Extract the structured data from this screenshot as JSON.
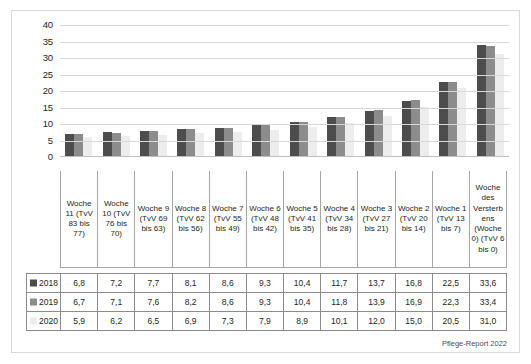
{
  "footer": {
    "source": "Pflege-Report 2022"
  },
  "legend": {
    "items": [
      {
        "label": "2018",
        "color": "#4d4d4d"
      },
      {
        "label": "2019",
        "color": "#8c8c8c"
      },
      {
        "label": "2020",
        "color": "#ededed"
      }
    ]
  },
  "chart_data": {
    "type": "bar",
    "title": "",
    "xlabel": "",
    "ylabel": "",
    "ylim": [
      0,
      40
    ],
    "yticks": [
      0,
      5,
      10,
      15,
      20,
      25,
      30,
      35,
      40
    ],
    "grid": true,
    "legend_position": "table-row-headers",
    "categories": [
      "Woche 11 (TvV 83 bis 77)",
      "Woche 10 (TvV 76 bis 70)",
      "Woche 9 (TvV 69 bis 63)",
      "Woche 8 (TvV 62 bis 56)",
      "Woche 7 (TvV 55 bis 49)",
      "Woche 6 (TvV 48 bis 42)",
      "Woche 5 (TvV 41 bis 35)",
      "Woche 4 (TvV 34 bis 28)",
      "Woche 3 (TvV 27 bis 21)",
      "Woche 2 (TvV 20 bis 14)",
      "Woche 1 (TvV 13 bis 7)",
      "Woche des Versterbens (Woche 0) (TvV 6 bis 0)"
    ],
    "series": [
      {
        "name": "2018",
        "color": "#4d4d4d",
        "values": [
          6.8,
          7.2,
          7.7,
          8.1,
          8.6,
          9.3,
          10.4,
          11.7,
          13.7,
          16.8,
          22.5,
          33.6
        ]
      },
      {
        "name": "2019",
        "color": "#8c8c8c",
        "values": [
          6.7,
          7.1,
          7.6,
          8.2,
          8.6,
          9.3,
          10.4,
          11.8,
          13.9,
          16.9,
          22.3,
          33.4
        ]
      },
      {
        "name": "2020",
        "color": "#ededed",
        "values": [
          5.9,
          6.2,
          6.5,
          6.9,
          7.3,
          7.9,
          8.9,
          10.1,
          12.0,
          15.0,
          20.5,
          31.0
        ]
      }
    ]
  },
  "table": {
    "rows": [
      {
        "header": "2018",
        "values": [
          "6,8",
          "7,2",
          "7,7",
          "8,1",
          "8,6",
          "9,3",
          "10,4",
          "11,7",
          "13,7",
          "16,8",
          "22,5",
          "33,6"
        ]
      },
      {
        "header": "2019",
        "values": [
          "6,7",
          "7,1",
          "7,6",
          "8,2",
          "8,6",
          "9,3",
          "10,4",
          "11,8",
          "13,9",
          "16,9",
          "22,3",
          "33,4"
        ]
      },
      {
        "header": "2020",
        "values": [
          "5,9",
          "6,2",
          "6,5",
          "6,9",
          "7,3",
          "7,9",
          "8,9",
          "10,1",
          "12,0",
          "15,0",
          "20,5",
          "31,0"
        ]
      }
    ]
  }
}
